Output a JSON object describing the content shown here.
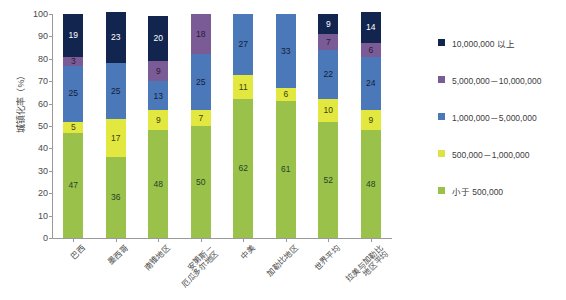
{
  "chart_data": {
    "type": "bar",
    "stacked": true,
    "title": "",
    "xlabel": "",
    "ylabel": "城镇化率（%）",
    "ylim": [
      0,
      100
    ],
    "yticks": [
      0,
      10,
      20,
      30,
      40,
      50,
      60,
      70,
      80,
      90,
      100
    ],
    "ytick_labels": [
      "0",
      "10",
      "20",
      "30",
      "40",
      "50",
      "60",
      "70",
      "80",
      "90",
      "100"
    ],
    "grid": false,
    "legend_position": "right",
    "categories": [
      "巴西",
      "墨西哥",
      "南锥地区",
      "安第斯－\n厄瓜多尔地区",
      "中美",
      "加勒比地区",
      "世界平均",
      "拉美与加勒比\n地区平均"
    ],
    "series": [
      {
        "name": "小于 500,000",
        "color": "#9ac24a",
        "label_color": "#24422a",
        "values": [
          47,
          36,
          48,
          50,
          62,
          61,
          52,
          48
        ]
      },
      {
        "name": "500,000－1,000,000",
        "color": "#e2e83f",
        "label_color": "#3a3f10",
        "values": [
          5,
          17,
          9,
          7,
          11,
          6,
          10,
          9
        ]
      },
      {
        "name": "1,000,000－5,000,000",
        "color": "#4a78b8",
        "label_color": "#10213d",
        "values": [
          25,
          25,
          13,
          25,
          27,
          33,
          22,
          24
        ]
      },
      {
        "name": "5,000,000－10,000,000",
        "color": "#7a5b96",
        "label_color": "#2a1a36",
        "values": [
          4,
          0,
          9,
          18,
          0,
          0,
          7,
          6
        ]
      },
      {
        "name": "10,000,000 以上",
        "color": "#12254f",
        "label_color": "#ffffff",
        "values": [
          19,
          23,
          20,
          0,
          0,
          0,
          9,
          14
        ]
      }
    ],
    "data_labels": [
      [
        "47",
        "5",
        "25",
        "3",
        "19"
      ],
      [
        "36",
        "17",
        "25",
        "",
        "23"
      ],
      [
        "48",
        "9",
        "13",
        "9",
        "20"
      ],
      [
        "50",
        "7",
        "25",
        "18",
        ""
      ],
      [
        "62",
        "11",
        "27",
        "",
        ""
      ],
      [
        "61",
        "6",
        "33",
        "",
        ""
      ],
      [
        "52",
        "10",
        "22",
        "7",
        "9"
      ],
      [
        "48",
        "9",
        "24",
        "6",
        "14"
      ]
    ]
  },
  "legend": {
    "items": [
      {
        "label": "10,000,000 以上",
        "color": "#12254f"
      },
      {
        "label": "5,000,000－10,000,000",
        "color": "#7a5b96"
      },
      {
        "label": "1,000,000－5,000,000",
        "color": "#4a78b8"
      },
      {
        "label": "500,000－1,000,000",
        "color": "#dde345"
      },
      {
        "label": "小于 500,000",
        "color": "#9ac24a"
      }
    ]
  }
}
